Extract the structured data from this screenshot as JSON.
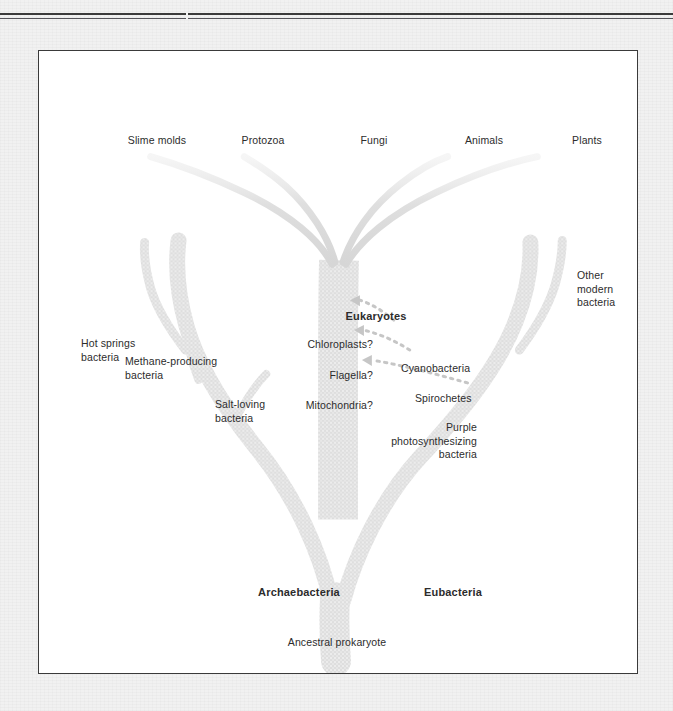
{
  "figure": {
    "title_absent": true,
    "background_color": "#f1f1f1",
    "panel_color": "#ffffff",
    "border_color": "#3a3a3a",
    "tree_color": "#d8d8d8",
    "arrow_color": "#c9c9c9",
    "text_color": "#2c2c2c"
  },
  "diagram": {
    "type": "phylogenetic-tree",
    "root_label": "Ancestral prokaryote",
    "domains": [
      "Archaebacteria",
      "Eubacteria",
      "Eukaryotes"
    ],
    "labels": [
      {
        "id": "slime-molds",
        "text": "Slime molds",
        "x": 118,
        "y": 89,
        "align": "center",
        "bold": false
      },
      {
        "id": "protozoa",
        "text": "Protozoa",
        "x": 224,
        "y": 89,
        "align": "center",
        "bold": false
      },
      {
        "id": "fungi",
        "text": "Fungi",
        "x": 335,
        "y": 89,
        "align": "center",
        "bold": false
      },
      {
        "id": "animals",
        "text": "Animals",
        "x": 445,
        "y": 89,
        "align": "center",
        "bold": false
      },
      {
        "id": "plants",
        "text": "Plants",
        "x": 548,
        "y": 89,
        "align": "center",
        "bold": false
      },
      {
        "id": "other-modern-bacteria",
        "text": "Other\nmodern\nbacteria",
        "x": 576,
        "y": 224,
        "align": "left",
        "bold": false
      },
      {
        "id": "eukaryotes",
        "text": "Eukaryotes",
        "x": 337,
        "y": 260,
        "align": "center",
        "bold": true
      },
      {
        "id": "hot-springs-bacteria",
        "text": "Hot springs\nbacteria",
        "x": 80,
        "y": 291,
        "align": "left",
        "bold": false
      },
      {
        "id": "chloroplasts",
        "text": "Chloroplasts?",
        "x": 371,
        "y": 289,
        "align": "right",
        "bold": false
      },
      {
        "id": "methane-producing-bacteria",
        "text": "Methane-producing\nbacteria",
        "x": 124,
        "y": 308,
        "align": "left",
        "bold": false
      },
      {
        "id": "cyanobacteria",
        "text": "Cyanobacteria",
        "x": 400,
        "y": 315,
        "align": "left",
        "bold": false
      },
      {
        "id": "flagella",
        "text": "Flagella?",
        "x": 371,
        "y": 320,
        "align": "right",
        "bold": false
      },
      {
        "id": "spirochetes",
        "text": "Spirochetes",
        "x": 414,
        "y": 344,
        "align": "left",
        "bold": false
      },
      {
        "id": "salt-loving-bacteria",
        "text": "Salt-loving\nbacteria",
        "x": 214,
        "y": 351,
        "align": "left",
        "bold": false
      },
      {
        "id": "mitochondria",
        "text": "Mitochondria?",
        "x": 371,
        "y": 351,
        "align": "right",
        "bold": false
      },
      {
        "id": "purple-photosynthesizing-bacteria",
        "text": "Purple\nphotosynthesizing\nbacteria",
        "x": 476,
        "y": 374,
        "align": "right",
        "bold": false
      },
      {
        "id": "archaebacteria",
        "text": "Archaebacteria",
        "x": 260,
        "y": 537,
        "align": "center",
        "bold": true
      },
      {
        "id": "eubacteria",
        "text": "Eubacteria",
        "x": 414,
        "y": 537,
        "align": "center",
        "bold": true
      },
      {
        "id": "ancestral-prokaryote",
        "text": "Ancestral prokaryote",
        "x": 336,
        "y": 634,
        "align": "center",
        "bold": false
      }
    ],
    "endosymbiosis_arrows": [
      {
        "id": "arrow-chloroplasts-from-cyanobacteria",
        "from": "Cyanobacteria",
        "to": "Chloroplasts?"
      },
      {
        "id": "arrow-flagella-from-spirochetes",
        "from": "Spirochetes",
        "to": "Flagella?"
      },
      {
        "id": "arrow-mitochondria-from-purple-bacteria",
        "from": "Purple photosynthesizing bacteria",
        "to": "Mitochondria?"
      }
    ]
  }
}
